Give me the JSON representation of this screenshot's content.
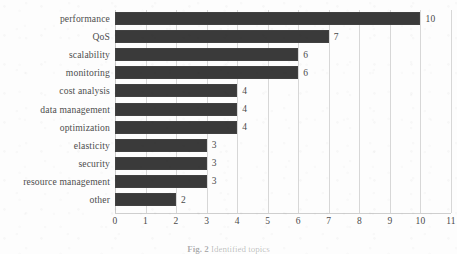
{
  "figure": {
    "caption_label": "Fig. 2",
    "caption_text": "Identified topics"
  },
  "chart_data": {
    "type": "bar",
    "orientation": "horizontal",
    "title": "",
    "xlabel": "",
    "ylabel": "",
    "categories": [
      "performance",
      "QoS",
      "scalability",
      "monitoring",
      "cost analysis",
      "data management",
      "optimization",
      "elasticity",
      "security",
      "resource management",
      "other"
    ],
    "values": [
      10,
      7,
      6,
      6,
      4,
      4,
      4,
      3,
      3,
      3,
      2
    ],
    "value_labels": [
      "10",
      "7",
      "6",
      "6",
      "4",
      "4",
      "4",
      "3",
      "3",
      "3",
      "2"
    ],
    "xlim": [
      0,
      11
    ],
    "xticks": [
      0,
      1,
      2,
      3,
      4,
      5,
      6,
      7,
      8,
      9,
      10,
      11
    ],
    "xtick_labels": [
      "0",
      "1",
      "2",
      "3",
      "4",
      "5",
      "6",
      "7",
      "8",
      "9",
      "10",
      "11"
    ],
    "grid": "vertical",
    "legend": "none",
    "bar_color": "#3a3a3a",
    "gridline_color": "#d7d7d7",
    "text_color": "#4a4a4a",
    "background_color": "#fdfdfd"
  }
}
